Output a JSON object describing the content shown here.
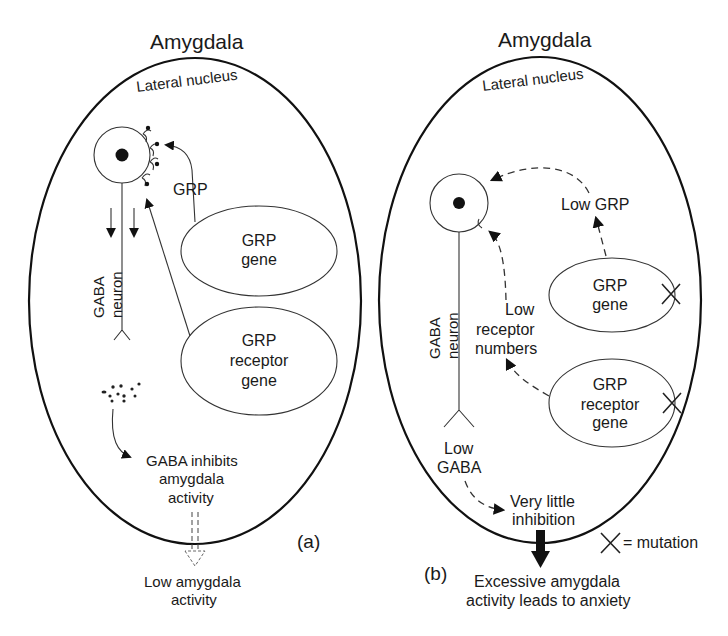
{
  "figure": {
    "panel_a": {
      "label": "(a)",
      "title": "Amygdala",
      "region": "Lateral nucleus",
      "neuron": {
        "line1": "GABA",
        "line2": "neuron"
      },
      "grp_signal": "GRP",
      "grp_gene": {
        "line1": "GRP",
        "line2": "gene"
      },
      "receptor_gene": {
        "line1": "GRP",
        "line2": "receptor",
        "line3": "gene"
      },
      "gaba_effect": {
        "line1": "GABA inhibits",
        "line2": "amygdala",
        "line3": "activity"
      },
      "outcome": {
        "line1": "Low amygdala",
        "line2": "activity"
      }
    },
    "panel_b": {
      "label": "(b)",
      "title": "Amygdala",
      "region": "Lateral nucleus",
      "neuron": {
        "line1": "GABA",
        "line2": "neuron"
      },
      "grp_signal": "Low GRP",
      "receptor_signal": {
        "line1": "Low",
        "line2": "receptor",
        "line3": "numbers"
      },
      "grp_gene": {
        "line1": "GRP",
        "line2": "gene"
      },
      "receptor_gene": {
        "line1": "GRP",
        "line2": "receptor",
        "line3": "gene"
      },
      "gaba_level": {
        "line1": "Low",
        "line2": "GABA"
      },
      "gaba_effect": {
        "line1": "Very little",
        "line2": "inhibition"
      },
      "outcome": {
        "line1": "Excessive amygdala",
        "line2": "activity leads to anxiety"
      },
      "legend": {
        "symbol": "X",
        "text": "= mutation"
      }
    }
  }
}
